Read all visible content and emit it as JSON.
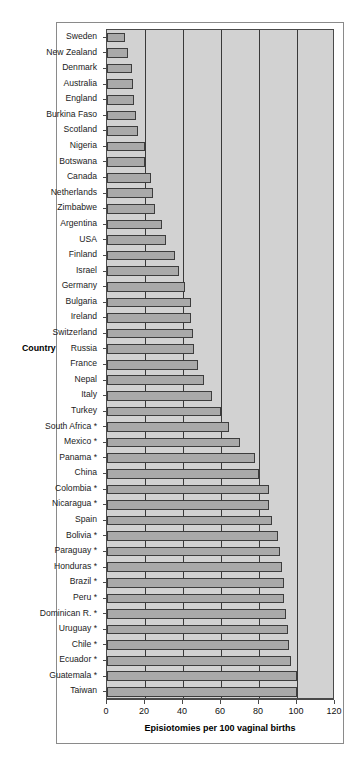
{
  "chart_data": {
    "type": "bar",
    "orientation": "horizontal",
    "title": "",
    "xlabel": "Episiotomies per 100 vaginal births",
    "ylabel": "Country",
    "xlim": [
      0,
      120
    ],
    "xticks": [
      0,
      20,
      40,
      60,
      80,
      100,
      120
    ],
    "xticklabels": [
      "0",
      "20",
      "40",
      "60",
      "80",
      "100",
      "120"
    ],
    "grid": true,
    "grid_axis": "x",
    "legend": null,
    "categories": [
      "Sweden",
      "New Zealand",
      "Denmark",
      "Australia",
      "England",
      "Burkina Faso",
      "Scotland",
      "Nigeria",
      "Botswana",
      "Canada",
      "Netherlands",
      "Zimbabwe",
      "Argentina",
      "USA",
      "Finland",
      "Israel",
      "Germany",
      "Bulgaria",
      "Ireland",
      "Switzerland",
      "Russia",
      "France",
      "Nepal",
      "Italy",
      "Turkey",
      "South Africa *",
      "Mexico *",
      "Panama *",
      "China",
      "Colombia *",
      "Nicaragua *",
      "Spain",
      "Bolivia *",
      "Paraguay *",
      "Honduras *",
      "Brazil *",
      "Peru *",
      "Dominican R. *",
      "Uruguay *",
      "Chile *",
      "Ecuador *",
      "Guatemala *",
      "Taiwan"
    ],
    "values": [
      9.5,
      11,
      13,
      13.5,
      14,
      15,
      16.5,
      20,
      20,
      23,
      24,
      25,
      29,
      31,
      36,
      38,
      41,
      44,
      44,
      45,
      46,
      48,
      51,
      55,
      60,
      64,
      70,
      78,
      80,
      85,
      85,
      87,
      90,
      91,
      92,
      93,
      93,
      94,
      95,
      96,
      97,
      100,
      100
    ],
    "colors": {
      "bar_fill": "#a9a9a9",
      "bar_edge": "#3d3d3d",
      "plot_background": "#d2d2d2",
      "gridline": "#3a3a3a",
      "figure_background": "#ffffff",
      "text": "#111111"
    }
  }
}
